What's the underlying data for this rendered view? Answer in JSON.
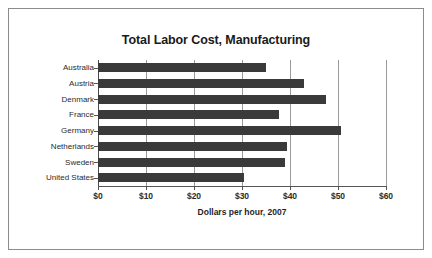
{
  "chart_data": {
    "type": "bar",
    "orientation": "horizontal",
    "title": "Total Labor Cost, Manufacturing",
    "xlabel": "Dollars per hour, 2007",
    "ylabel": "",
    "categories": [
      "Australia",
      "Austria",
      "Denmark",
      "France",
      "Germany",
      "Netherlands",
      "Sweden",
      "United States"
    ],
    "values": [
      35.0,
      43.0,
      47.5,
      37.7,
      50.6,
      39.4,
      39.0,
      30.4
    ],
    "xlim": [
      0,
      60
    ],
    "xticks": [
      0,
      10,
      20,
      30,
      40,
      50,
      60
    ],
    "xtick_labels": [
      "$0",
      "$10",
      "$20",
      "$30",
      "$40",
      "$50",
      "$60"
    ],
    "grid": true,
    "grid_axis": "x",
    "legend": false,
    "bar_color": "#3a3a3a",
    "background_color": "#ffffff",
    "border_color": "#8c8c8c"
  }
}
